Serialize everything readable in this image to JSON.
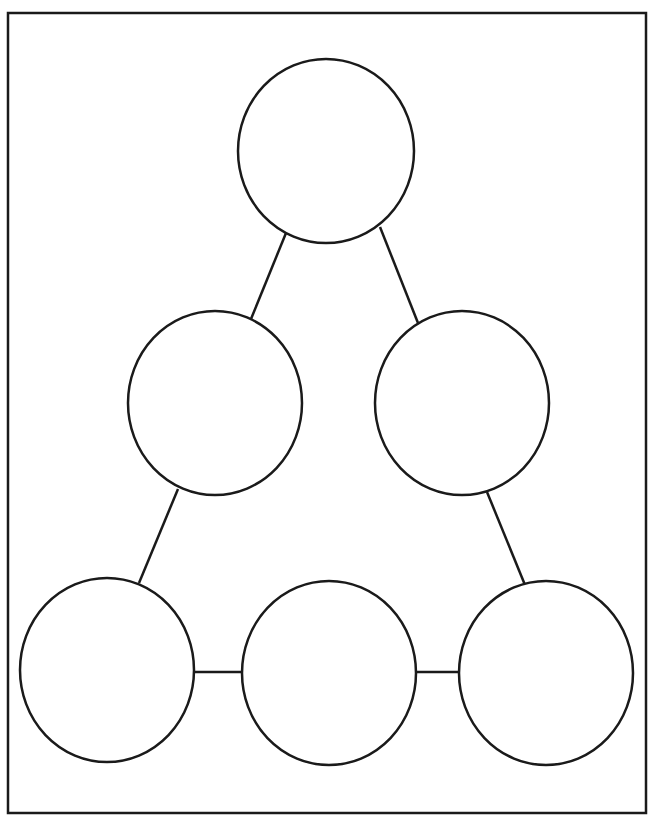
{
  "page": {
    "clipped_caption": ""
  },
  "diagram": {
    "type": "hierarchy-triangle",
    "frame": {
      "x": 8,
      "y": 13,
      "width": 638,
      "height": 800,
      "stroke": "#1a1a1a",
      "stroke_width": 2.5
    },
    "node_style": {
      "fill": "#ffffff",
      "stroke": "#1a1a1a",
      "stroke_width": 2.5
    },
    "nodes": [
      {
        "id": "top",
        "cx": 326,
        "cy": 151,
        "rx": 88,
        "ry": 92,
        "label": ""
      },
      {
        "id": "middle-left",
        "cx": 215,
        "cy": 403,
        "rx": 87,
        "ry": 92,
        "label": ""
      },
      {
        "id": "middle-right",
        "cx": 462,
        "cy": 403,
        "rx": 87,
        "ry": 92,
        "label": ""
      },
      {
        "id": "bottom-left",
        "cx": 107,
        "cy": 670,
        "rx": 87,
        "ry": 92,
        "label": ""
      },
      {
        "id": "bottom-middle",
        "cx": 329,
        "cy": 673,
        "rx": 87,
        "ry": 92,
        "label": ""
      },
      {
        "id": "bottom-right",
        "cx": 546,
        "cy": 673,
        "rx": 87,
        "ry": 92,
        "label": ""
      }
    ],
    "edges": [
      {
        "from": "top",
        "to": "middle-left",
        "x1": 286,
        "y1": 233,
        "x2": 251,
        "y2": 319
      },
      {
        "from": "top",
        "to": "middle-right",
        "x1": 380,
        "y1": 227,
        "x2": 418,
        "y2": 323
      },
      {
        "from": "middle-left",
        "to": "bottom-left",
        "x1": 178,
        "y1": 489,
        "x2": 139,
        "y2": 583
      },
      {
        "from": "middle-right",
        "to": "bottom-right",
        "x1": 487,
        "y1": 492,
        "x2": 525,
        "y2": 585
      },
      {
        "from": "bottom-left",
        "to": "bottom-middle",
        "x1": 193,
        "y1": 672,
        "x2": 243,
        "y2": 672
      },
      {
        "from": "bottom-middle",
        "to": "bottom-right",
        "x1": 416,
        "y1": 672,
        "x2": 460,
        "y2": 672
      }
    ]
  }
}
